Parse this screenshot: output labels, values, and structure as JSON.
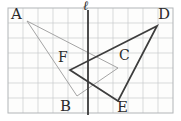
{
  "figure": {
    "labels": {
      "A": "A",
      "B": "B",
      "C": "C",
      "D": "D",
      "E": "E",
      "F": "F",
      "line": "ℓ"
    },
    "colors": {
      "paper": "#fdfdfc",
      "grid": "#c7cacc",
      "grid_border": "#b2b5b8",
      "light_triangle": "#9a9a9a",
      "dark_triangle": "#3d3d3d",
      "mirror_line": "#3a3a3a",
      "label_text": "#2b2b2b"
    },
    "grid": {
      "x": 8,
      "y": 8,
      "cols": 11,
      "rows": 7,
      "cell": 15
    },
    "mirror_line": {
      "x": 88,
      "y1": 10,
      "y2": 115
    },
    "points": {
      "A": [
        27,
        21
      ],
      "B": [
        77,
        96
      ],
      "C": [
        118,
        68
      ],
      "D": [
        157,
        26
      ],
      "E": [
        118,
        101
      ],
      "F": [
        70,
        70
      ]
    },
    "triangles": [
      {
        "name": "triangle-ABC",
        "vertices": [
          "A",
          "B",
          "C"
        ],
        "stroke": "light_triangle",
        "width": 0.9
      },
      {
        "name": "triangle-DEF",
        "vertices": [
          "D",
          "E",
          "F"
        ],
        "stroke": "dark_triangle",
        "width": 1.7
      }
    ]
  }
}
